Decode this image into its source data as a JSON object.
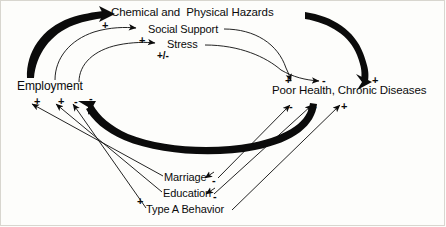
{
  "diagram": {
    "title_present": false,
    "type": "causal-loop-diagram",
    "background": "#fdfdfb",
    "ink": "#0b0b0b",
    "nodes": [
      {
        "id": "hazards",
        "label": "Chemical and  Physical Hazards"
      },
      {
        "id": "social",
        "label": "Social Support"
      },
      {
        "id": "stress",
        "label": "Stress"
      },
      {
        "id": "employment",
        "label": "Employment"
      },
      {
        "id": "poorhealth",
        "label": "Poor Health, Chronic Diseases"
      },
      {
        "id": "marriage",
        "label": "Marriage"
      },
      {
        "id": "education",
        "label": "Education"
      },
      {
        "id": "typea",
        "label": "Type A Behavior"
      }
    ],
    "signs": {
      "hazards_from_employment": "+",
      "social_from_employment": "+",
      "stress_from_employment": "+/-",
      "hazards_to_poorhealth": "+",
      "social_to_poorhealth": "+",
      "stress_to_poorhealth": "-",
      "poorhealth_to_employment": "-",
      "marriage_to_employment": "+",
      "education_to_employment": "+",
      "typea_to_employment": "-",
      "typea_sign_left": "+",
      "marriage_to_poorhealth": "-",
      "education_to_poorhealth": "-",
      "typea_to_poorhealth": "+",
      "marriage_self": "-",
      "education_self": "-"
    }
  }
}
